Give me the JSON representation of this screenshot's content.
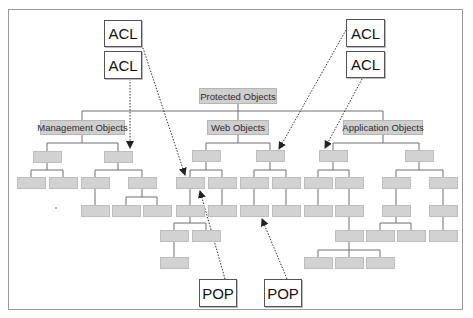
{
  "diagram": {
    "root": {
      "label": "Protected Objects"
    },
    "branches": [
      {
        "label": "Management Objects"
      },
      {
        "label": "Web Objects"
      },
      {
        "label": "Application Objects"
      }
    ],
    "acl_tags": [
      {
        "label": "ACL",
        "position": "top-left-1"
      },
      {
        "label": "ACL",
        "position": "top-left-2"
      },
      {
        "label": "ACL",
        "position": "top-right-1"
      },
      {
        "label": "ACL",
        "position": "top-right-2"
      }
    ],
    "pop_tags": [
      {
        "label": "POP",
        "position": "bottom-1"
      },
      {
        "label": "POP",
        "position": "bottom-2"
      }
    ],
    "colors": {
      "node_fill": "#d2d2d2",
      "label_node_fill": "#cfcfcf",
      "connector": "#6e6e6e",
      "tag_border": "#555555",
      "frame": "#9a9a9a"
    }
  }
}
